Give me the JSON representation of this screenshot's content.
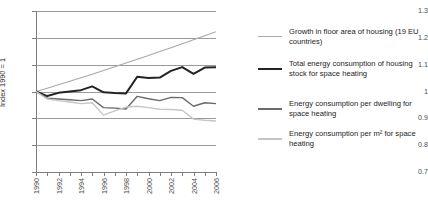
{
  "chart_data": {
    "type": "line",
    "title": "",
    "xlabel": "",
    "ylabel": "Index 1990 = 1",
    "xlim": [
      1990,
      2006
    ],
    "ylim": [
      0.7,
      1.3
    ],
    "grid": true,
    "legend_position": "right",
    "x": [
      1990,
      1991,
      1992,
      1993,
      1994,
      1995,
      1996,
      1997,
      1998,
      1999,
      2000,
      2001,
      2002,
      2003,
      2004,
      2005,
      2006
    ],
    "ytick_labels": [
      "1.3",
      "1.2",
      "1.1",
      "1",
      "0.9",
      "0.8",
      "0.7"
    ],
    "ytick_values": [
      1.3,
      1.2,
      1.1,
      1.0,
      0.9,
      0.8,
      0.7
    ],
    "xtick_labels": [
      "1990",
      "1992",
      "1994",
      "1996",
      "1998",
      "2000",
      "2002",
      "2004",
      "2006"
    ],
    "xtick_values": [
      1990,
      1992,
      1994,
      1996,
      1998,
      2000,
      2002,
      2004,
      2006
    ],
    "series": [
      {
        "name": "Growth in floor area of housing (19 EU countries)",
        "color": "#a8a8a8",
        "width": 1.1,
        "values": [
          1.0,
          1.012,
          1.025,
          1.038,
          1.051,
          1.064,
          1.078,
          1.092,
          1.106,
          1.12,
          1.134,
          1.149,
          1.163,
          1.178,
          1.193,
          1.208,
          1.223
        ]
      },
      {
        "name": "Total energy consumption of housing stock for space heating",
        "color": "#232323",
        "width": 2.0,
        "values": [
          1.0,
          0.983,
          0.995,
          1.0,
          1.005,
          1.019,
          0.997,
          0.994,
          0.993,
          1.055,
          1.05,
          1.052,
          1.077,
          1.091,
          1.066,
          1.089,
          1.09
        ]
      },
      {
        "name": "Energy consumption per dwelling for space heating",
        "color": "#6a6a6a",
        "width": 1.4,
        "values": [
          1.0,
          0.975,
          0.972,
          0.969,
          0.966,
          0.972,
          0.94,
          0.938,
          0.935,
          0.982,
          0.973,
          0.966,
          0.978,
          0.977,
          0.945,
          0.958,
          0.955
        ]
      },
      {
        "name": "Energy consumption per m² for space heating",
        "color": "#c6c6c6",
        "width": 1.4,
        "values": [
          1.0,
          0.972,
          0.966,
          0.961,
          0.955,
          0.958,
          0.912,
          0.928,
          0.942,
          0.945,
          0.94,
          0.934,
          0.933,
          0.93,
          0.897,
          0.893,
          0.89
        ]
      }
    ]
  },
  "legend": {
    "items": [
      {
        "label": "Growth in floor area of housing (19 EU countries)",
        "color": "#a8a8a8",
        "thickness": "1.2px",
        "top": 8
      },
      {
        "label": "Total energy consumption of housing stock for space heating",
        "color": "#232323",
        "thickness": "2.4px",
        "top": 40
      },
      {
        "label": "Energy consumption per dwelling for space heating",
        "color": "#6a6a6a",
        "thickness": "1.6px",
        "top": 80
      },
      {
        "label": "Energy consumption per m² for space heating",
        "color": "#c6c6c6",
        "thickness": "1.6px",
        "top": 110
      }
    ]
  },
  "footer": {
    "partial_text": ""
  }
}
